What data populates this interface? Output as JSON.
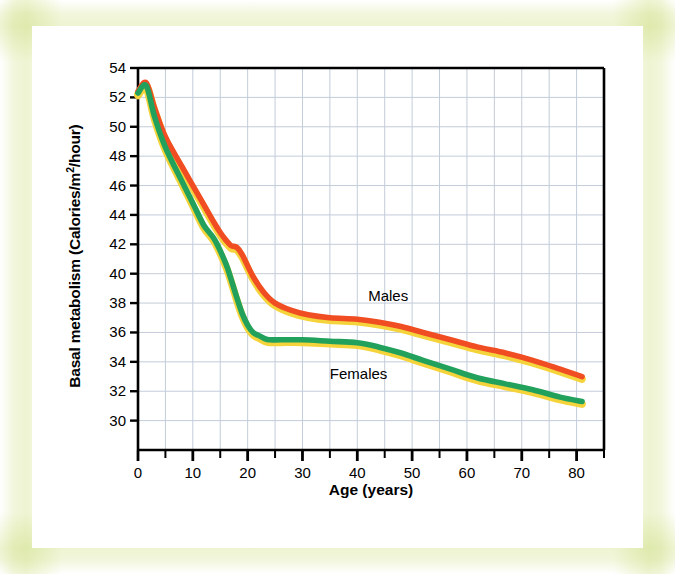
{
  "figure": {
    "background_color": "#ffffff",
    "frame_tint_color": "#eef4d2"
  },
  "chart_data": {
    "type": "line",
    "title": "",
    "subtitle": "",
    "xlabel": "Age (years)",
    "ylabel_full": "Basal metabolism (Calories/m2/hour)",
    "ylabel_prefix": "Basal metabolism (Calories/m",
    "ylabel_exponent": "2",
    "ylabel_suffix": "/hour)",
    "xlim": [
      0,
      85
    ],
    "ylim": [
      28,
      54
    ],
    "xticks": [
      0,
      10,
      20,
      30,
      40,
      50,
      60,
      70,
      80
    ],
    "xtick_labels": [
      "0",
      "10",
      "20",
      "30",
      "40",
      "50",
      "60",
      "70",
      "80"
    ],
    "xminor_step": 5,
    "yticks": [
      30,
      32,
      34,
      36,
      38,
      40,
      42,
      44,
      46,
      48,
      50,
      52,
      54
    ],
    "ytick_labels": [
      "30",
      "32",
      "34",
      "36",
      "38",
      "40",
      "42",
      "44",
      "46",
      "48",
      "50",
      "52",
      "54"
    ],
    "grid": true,
    "grid_color": "#c3ccd9",
    "axis_color": "#000000",
    "legend_position": "inline-annotations",
    "series": [
      {
        "name": "Males",
        "color": "#f04d23",
        "shadow_color": "#f5d33a",
        "label_x": 46,
        "label_y": 38.5,
        "x": [
          0,
          1.5,
          3,
          5,
          8,
          10,
          12,
          14,
          15,
          16,
          17,
          18,
          19,
          21,
          23,
          25,
          28,
          31,
          35,
          40,
          44,
          48,
          52,
          57,
          62,
          67,
          72,
          77,
          81
        ],
        "y": [
          52.4,
          53.0,
          51.3,
          49.3,
          47.3,
          46.0,
          44.7,
          43.4,
          42.8,
          42.3,
          41.9,
          41.8,
          41.3,
          39.8,
          38.7,
          38.0,
          37.5,
          37.2,
          37.0,
          36.9,
          36.7,
          36.4,
          36.0,
          35.5,
          35.0,
          34.6,
          34.1,
          33.5,
          33.0
        ]
      },
      {
        "name": "Females",
        "color": "#22a15c",
        "shadow_color": "#f5d33a",
        "label_x": 39,
        "label_y": 33.2,
        "x": [
          0,
          1.5,
          3,
          5,
          8,
          10,
          12,
          14,
          16,
          17,
          18,
          19,
          20,
          21,
          22,
          23,
          24,
          26,
          30,
          35,
          40,
          44,
          48,
          52,
          57,
          62,
          67,
          72,
          77,
          81
        ],
        "y": [
          52.3,
          52.8,
          50.7,
          48.6,
          46.3,
          44.8,
          43.3,
          42.3,
          40.7,
          39.6,
          38.4,
          37.3,
          36.5,
          36.0,
          35.8,
          35.6,
          35.5,
          35.5,
          35.5,
          35.4,
          35.3,
          35.0,
          34.6,
          34.1,
          33.5,
          32.9,
          32.5,
          32.1,
          31.6,
          31.3
        ]
      }
    ],
    "annotations": [
      {
        "text": "Males",
        "x": 46,
        "y": 38.5
      },
      {
        "text": "Females",
        "x": 39,
        "y": 33.2
      }
    ]
  }
}
